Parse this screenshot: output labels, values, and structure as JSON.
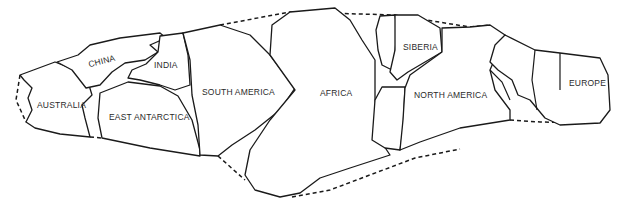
{
  "map": {
    "type": "paleogeographic-reconstruction",
    "colors": {
      "line": "#1a1a1a",
      "background": "#ffffff"
    },
    "labels": [
      {
        "id": "china",
        "text": "CHINA",
        "x": 88,
        "y": 56,
        "rotate": -14
      },
      {
        "id": "india",
        "text": "INDIA",
        "x": 154,
        "y": 60,
        "rotate": 0
      },
      {
        "id": "australia",
        "text": "AUSTRALIA",
        "x": 37,
        "y": 100,
        "rotate": 0
      },
      {
        "id": "east-antarctica",
        "text": "EAST ANTARCTICA",
        "x": 109,
        "y": 112,
        "rotate": 0
      },
      {
        "id": "south-america",
        "text": "SOUTH AMERICA",
        "x": 202,
        "y": 87,
        "rotate": 0
      },
      {
        "id": "africa",
        "text": "AFRICA",
        "x": 320,
        "y": 88,
        "rotate": 0
      },
      {
        "id": "siberia",
        "text": "SIBERIA",
        "x": 403,
        "y": 42,
        "rotate": 0
      },
      {
        "id": "north-america",
        "text": "NORTH AMERICA",
        "x": 414,
        "y": 90,
        "rotate": 0
      },
      {
        "id": "europe",
        "text": "EUROPE",
        "x": 569,
        "y": 78,
        "rotate": 0
      }
    ]
  }
}
